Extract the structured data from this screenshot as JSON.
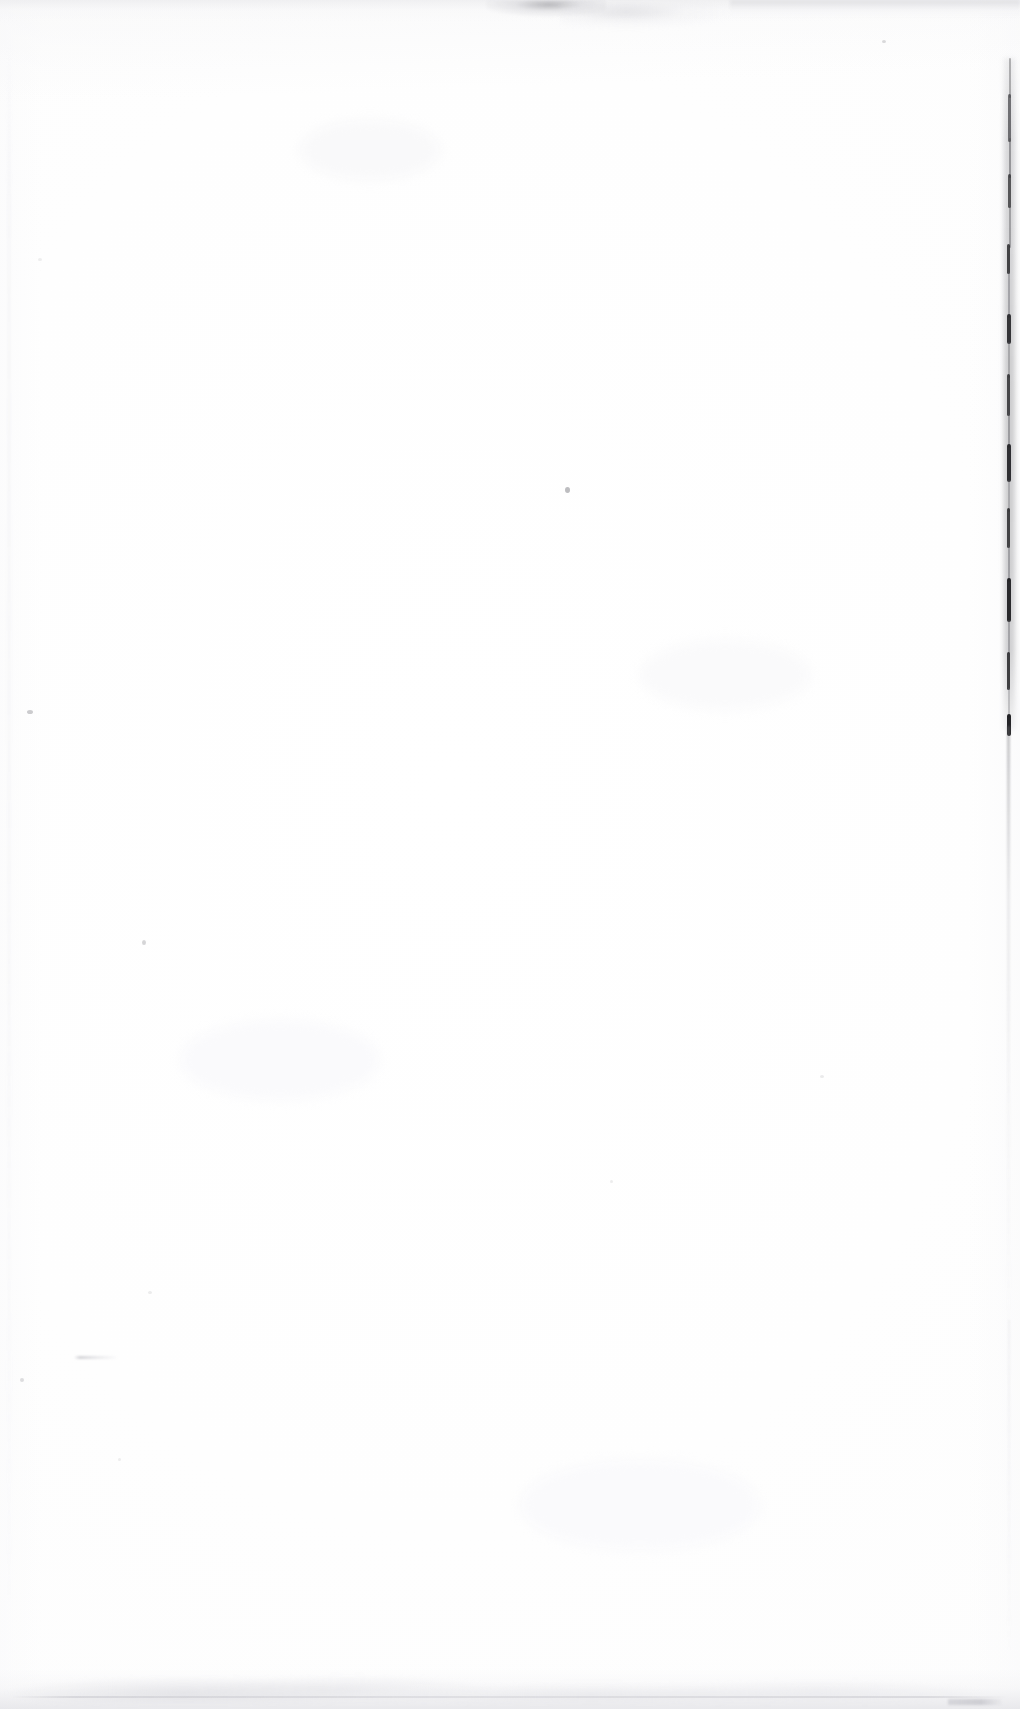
{
  "document": {
    "kind": "scanned-page-image",
    "page_state": "blank",
    "visible_text": "",
    "background_color": "#ffffff",
    "ink_color": "#2a2a2c",
    "shadow_color": "#e2e2e6",
    "width_px": 1020,
    "height_px": 1709
  },
  "artifacts": {
    "binding_edge": {
      "name": "right page binding edge",
      "color": "#2a2a2c",
      "x_px": 1008,
      "y_start_px": 58,
      "y_end_px": 728
    },
    "top_smudge": {
      "name": "top scan smudge band",
      "color": "#96969b",
      "y_px": 0,
      "height_px": 26
    },
    "bottom_shadow": {
      "name": "bottom page edge shadow",
      "color": "#e2e2e6",
      "height_px": 56
    },
    "specks": [
      {
        "name": "ink-speck-center",
        "x": 565,
        "y": 487,
        "size": 5,
        "opacity": 0.72
      },
      {
        "name": "ink-speck-left-upper",
        "x": 27,
        "y": 710,
        "size": 5,
        "opacity": 0.55
      },
      {
        "name": "ink-speck-left-mid",
        "x": 142,
        "y": 940,
        "size": 4,
        "opacity": 0.45
      },
      {
        "name": "ink-speck-top-right",
        "x": 882,
        "y": 40,
        "size": 3,
        "opacity": 0.4
      },
      {
        "name": "ink-speck-lower-left",
        "x": 20,
        "y": 1378,
        "size": 3.5,
        "opacity": 0.35
      },
      {
        "name": "ink-speck-mid-right",
        "x": 820,
        "y": 1075,
        "size": 3,
        "opacity": 0.22
      },
      {
        "name": "ink-speck-low-center",
        "x": 610,
        "y": 1180,
        "size": 2.5,
        "opacity": 0.2
      },
      {
        "name": "ink-speck-upper-left",
        "x": 38,
        "y": 258,
        "size": 3,
        "opacity": 0.18
      },
      {
        "name": "ink-speck-low-left2",
        "x": 148,
        "y": 1291,
        "size": 3,
        "opacity": 0.2
      },
      {
        "name": "ink-speck-mid-left",
        "x": 118,
        "y": 1458,
        "size": 2.5,
        "opacity": 0.18
      }
    ],
    "stroke_smudge": {
      "name": "faint pencil stroke lower left",
      "x": 74,
      "y": 1356,
      "width": 42,
      "height": 3
    }
  }
}
